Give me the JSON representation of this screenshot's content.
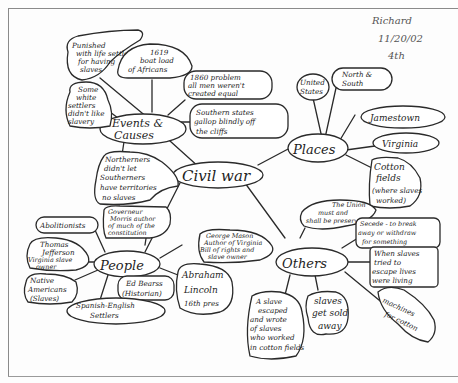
{
  "header": {
    "name": "Richard",
    "date": "11/20/02",
    "period": "4th"
  },
  "center": {
    "label": "Civil war"
  },
  "hubs": {
    "events": {
      "label_line1": "Events &",
      "label_line2": "Causes"
    },
    "places": {
      "label": "Places"
    },
    "people": {
      "label": "People"
    },
    "others": {
      "label": "Others"
    }
  },
  "events_nodes": [
    {
      "lines": [
        "Punished",
        "with life settlers",
        "for having",
        "slaves"
      ]
    },
    {
      "lines": [
        "1619",
        "boat load",
        "of Africans"
      ]
    },
    {
      "lines": [
        "Some",
        "white",
        "settlers",
        "didn't like",
        "slavery"
      ]
    },
    {
      "lines": [
        "1860 problem",
        "all men weren't",
        "created equal"
      ]
    },
    {
      "lines": [
        "Southern states",
        "gallop blindly off",
        "the cliffs"
      ]
    },
    {
      "lines": [
        "Northerners",
        "didn't let",
        "Southerners",
        "have territories",
        "no slaves"
      ]
    }
  ],
  "places_nodes": [
    {
      "lines": [
        "United",
        "States"
      ]
    },
    {
      "lines": [
        "North &",
        "South"
      ]
    },
    {
      "lines": [
        "Jamestown"
      ]
    },
    {
      "lines": [
        "Virginia"
      ]
    },
    {
      "lines": [
        "Cotton",
        "fields",
        "(where slaves",
        "worked)"
      ]
    }
  ],
  "people_nodes": [
    {
      "lines": [
        "Abolitionists"
      ]
    },
    {
      "lines": [
        "Governeur",
        "Morris author",
        "of much of the",
        "constitution"
      ]
    },
    {
      "lines": [
        "Thomas",
        "Jefferson",
        "Virginia slave",
        "owner"
      ]
    },
    {
      "lines": [
        "Native",
        "Americans",
        "(Slaves)"
      ]
    },
    {
      "lines": [
        "Ed Bearss",
        "(Historian)"
      ]
    },
    {
      "lines": [
        "Spanish-English",
        "Settlers"
      ]
    },
    {
      "lines": [
        "George Mason",
        "Author of Virginia",
        "Bill of rights and",
        "slave owner"
      ]
    },
    {
      "lines": [
        "Abraham",
        "Lincoln",
        "16th pres"
      ]
    }
  ],
  "others_nodes": [
    {
      "lines": [
        "The Union",
        "must and",
        "shall be preserved"
      ]
    },
    {
      "lines": [
        "Secede - to break",
        "away or withdraw",
        "for something"
      ]
    },
    {
      "lines": [
        "When slaves",
        "tried to",
        "escape lives",
        "were living"
      ]
    },
    {
      "lines": [
        "A slave",
        "escaped",
        "and wrote",
        "of slaves",
        "who worked",
        "in cotton fields"
      ]
    },
    {
      "lines": [
        "slaves",
        "get sold",
        "away"
      ]
    },
    {
      "lines": [
        "machines",
        "for cotton"
      ]
    }
  ],
  "colors": {
    "ink": "#2a2a2a",
    "pencil": "#555555",
    "paper": "#fdfdfd",
    "frame": "#8a8a8a"
  }
}
